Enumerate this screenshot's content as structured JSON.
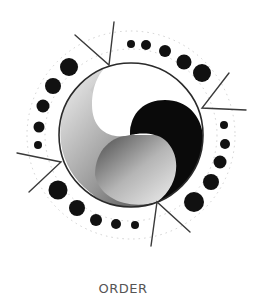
{
  "caption": "ORDER",
  "colors": {
    "background": "#ffffff",
    "ink": "#111111",
    "line": "#333333",
    "ring": "#bbbbbb",
    "caption": "#555555"
  },
  "emblem": {
    "circle": {
      "cx": 131,
      "cy": 135,
      "r": 72
    },
    "dot_arcs": [
      {
        "name": "top-right",
        "dots": [
          [
            131,
            44,
            4
          ],
          [
            146,
            45,
            5
          ],
          [
            165,
            51,
            6
          ],
          [
            184,
            62,
            7.5
          ],
          [
            202,
            73,
            9
          ]
        ]
      },
      {
        "name": "left",
        "dots": [
          [
            69,
            67,
            9
          ],
          [
            53,
            86,
            8
          ],
          [
            43,
            106,
            6.5
          ],
          [
            39,
            127,
            5.5
          ],
          [
            38,
            145,
            4
          ]
        ]
      },
      {
        "name": "right",
        "dots": [
          [
            224,
            125,
            4
          ],
          [
            225,
            144,
            5
          ],
          [
            220,
            162,
            6.5
          ],
          [
            211,
            182,
            8
          ],
          [
            194,
            202,
            10
          ]
        ]
      },
      {
        "name": "bottom-left",
        "dots": [
          [
            58,
            190,
            9.5
          ],
          [
            77,
            208,
            8
          ],
          [
            96,
            220,
            6
          ],
          [
            116,
            224,
            5
          ],
          [
            135,
            225,
            4
          ]
        ]
      }
    ],
    "rays": [
      {
        "vertex": [
          109,
          65
        ],
        "ends": [
          [
            75,
            35
          ],
          [
            114,
            22
          ]
        ]
      },
      {
        "vertex": [
          202,
          108
        ],
        "ends": [
          [
            229,
            73
          ],
          [
            246,
            110
          ]
        ]
      },
      {
        "vertex": [
          61,
          162
        ],
        "ends": [
          [
            17,
            153
          ],
          [
            29,
            192
          ]
        ]
      },
      {
        "vertex": [
          157,
          202
        ],
        "ends": [
          [
            151,
            246
          ],
          [
            190,
            232
          ]
        ]
      }
    ]
  }
}
